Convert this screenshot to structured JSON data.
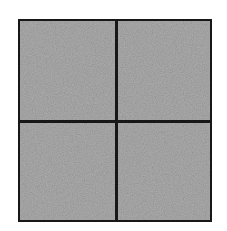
{
  "figure": {
    "canvas": {
      "width": 227,
      "height": 231,
      "background_color": "#ffffff"
    },
    "frame": {
      "name": "outer-square",
      "left": 18,
      "top": 19,
      "width": 194,
      "height": 203,
      "border_color": "#171717",
      "border_width": 3,
      "fill_color": "#b2b2b2",
      "fill_texture": "fine-grain-noise"
    },
    "dividers": [
      {
        "orientation": "vertical",
        "position_x": 116,
        "thickness": 3,
        "color": "#171717"
      },
      {
        "orientation": "horizontal",
        "position_y": 122,
        "thickness": 3,
        "color": "#171717"
      }
    ],
    "quadrants": [
      {
        "id": "top-left",
        "label": "",
        "fill_color": "#b2b2b2"
      },
      {
        "id": "top-right",
        "label": "",
        "fill_color": "#b2b2b2"
      },
      {
        "id": "bottom-left",
        "label": "",
        "fill_color": "#b2b2b2"
      },
      {
        "id": "bottom-right",
        "label": "",
        "fill_color": "#b2b2b2"
      }
    ]
  }
}
